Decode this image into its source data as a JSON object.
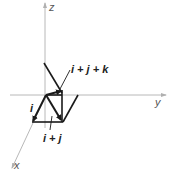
{
  "diagram": {
    "type": "3d-vector-diagram",
    "axes": {
      "z": {
        "label": "z"
      },
      "y": {
        "label": "y"
      },
      "x": {
        "label": "x"
      }
    },
    "vectors": [
      {
        "name": "i",
        "label": "i"
      },
      {
        "name": "i+j",
        "label": "i + j"
      },
      {
        "name": "i+j+k",
        "label": "i + j + k"
      }
    ],
    "colors": {
      "axis": "#b8b8b8",
      "vector": "#1a1a1a",
      "background": "#ffffff"
    }
  }
}
